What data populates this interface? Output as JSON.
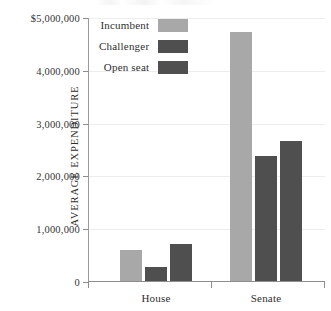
{
  "chart_data": {
    "type": "bar",
    "title": "",
    "subtitle": "",
    "xlabel": "",
    "ylabel": "AVERAGE EXPENDITURE",
    "categories": [
      "House",
      "Senate"
    ],
    "series": [
      {
        "name": "Incumbent",
        "color": "#a8a8a8",
        "values": [
          590000,
          4710000
        ]
      },
      {
        "name": "Challenger",
        "color": "#4f4f4f",
        "values": [
          265000,
          2360000
        ]
      },
      {
        "name": "Open seat",
        "color": "#4f4f4f",
        "values": [
          710000,
          2650000
        ]
      }
    ],
    "ylim": [
      0,
      5000000
    ],
    "ytick_values": [
      0,
      1000000,
      2000000,
      3000000,
      4000000,
      5000000
    ],
    "ytick_labels": [
      "0",
      "1,000,000",
      "2,000,000",
      "3,000,000",
      "4,000,000",
      "$5,000,000"
    ],
    "grid": true,
    "legend_position": "top-left-inside"
  },
  "legend": {
    "entries": [
      {
        "label": "Incumbent",
        "color": "#a8a8a8"
      },
      {
        "label": "Challenger",
        "color": "#4f4f4f"
      },
      {
        "label": "Open seat",
        "color": "#4f4f4f"
      }
    ]
  },
  "axis": {
    "y_title": "AVERAGE EXPENDITURE",
    "y_labels": [
      "$5,000,000",
      "4,000,000",
      "3,000,000",
      "2,000,000",
      "1,000,000",
      "0"
    ],
    "x_labels": [
      "House",
      "Senate"
    ]
  },
  "colors": {
    "light_bar": "#a8a8a8",
    "dark_bar": "#4f4f4f",
    "axis": "#8e8e8e",
    "grid": "#ededed",
    "text": "#2f2f2f",
    "background": "#ffffff"
  }
}
